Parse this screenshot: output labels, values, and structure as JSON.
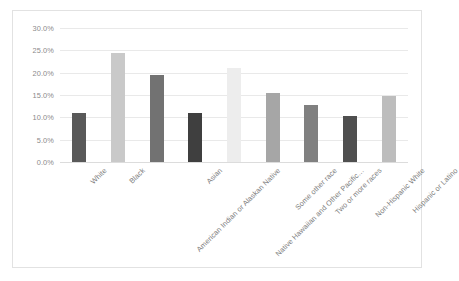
{
  "chart_data": {
    "type": "bar",
    "title": "",
    "xlabel": "",
    "ylabel": "",
    "ylim": [
      0,
      30
    ],
    "ytick_step": 5,
    "grid": true,
    "legend": "none",
    "ytick_labels": [
      "30.0%",
      "25.0%",
      "20.0%",
      "15.0%",
      "10.0%",
      "5.0%",
      "0.0%"
    ],
    "ytick_values": [
      30,
      25,
      20,
      15,
      10,
      5,
      0
    ],
    "categories": [
      "White",
      "Black",
      "American Indian or Alaskan Native",
      "Asian",
      "Native Hawaiian and Other Pacific…",
      "Some other race",
      "Two or more races",
      "Non-Hispanic White",
      "Hispanic or Latino"
    ],
    "values": [
      11.0,
      24.3,
      19.5,
      11.0,
      21.0,
      15.5,
      12.7,
      10.2,
      14.8
    ],
    "bar_colors": [
      "#595959",
      "#c9c9c9",
      "#727272",
      "#3f3f3f",
      "#ededed",
      "#a6a6a6",
      "#808080",
      "#4f4f4f",
      "#bdbdbd"
    ]
  },
  "style": {
    "plot_background": "#ffffff",
    "border_color": "#e2e2e2",
    "gridline_color": "#e9e9e9",
    "axis_text_color": "#8a8a8a"
  }
}
